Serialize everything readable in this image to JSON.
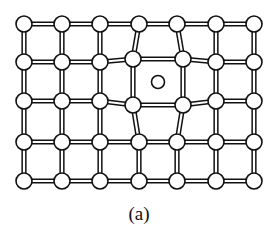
{
  "figure": {
    "caption": "(a)",
    "colors": {
      "line": "#111111",
      "fill": "#ffffff"
    },
    "atom_radius": 8,
    "interstitial_radius": 6.5,
    "columns_x": [
      24,
      62,
      100,
      139,
      177,
      216,
      254
    ],
    "rows_y": [
      24,
      62,
      101,
      142,
      181
    ],
    "displaced_atoms": [
      {
        "row": 1,
        "col": 3,
        "x": 133,
        "y": 59
      },
      {
        "row": 1,
        "col": 4,
        "x": 183,
        "y": 59
      },
      {
        "row": 2,
        "col": 3,
        "x": 133,
        "y": 105
      },
      {
        "row": 2,
        "col": 4,
        "x": 183,
        "y": 105
      }
    ],
    "interstitial_atom": {
      "x": 158,
      "y": 82
    }
  }
}
